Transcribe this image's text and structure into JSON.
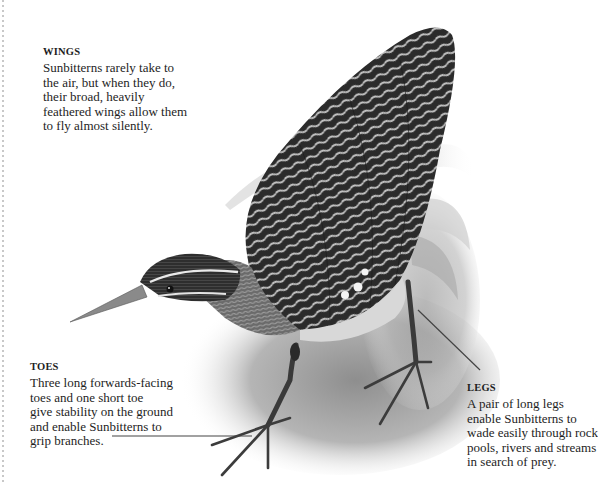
{
  "captions": {
    "wings": {
      "heading": "WINGS",
      "lines": [
        "Sunbitterns rarely take to",
        "the air, but when they do,",
        "their broad, heavily",
        "feathered wings allow them",
        "to fly almost silently."
      ]
    },
    "toes": {
      "heading": "TOES",
      "lines": [
        "Three long forwards-facing",
        "toes and one short toe",
        "give stability on the ground",
        "and enable Sunbitterns to",
        "grip branches."
      ]
    },
    "legs": {
      "heading": "LEGS",
      "lines": [
        "A pair of long legs",
        "enable Sunbitterns to",
        "wade easily through rock",
        "pools, rivers and streams",
        "in search of prey."
      ]
    }
  },
  "illustration": {
    "subject": "Sunbittern",
    "style": "grayscale",
    "colors": {
      "ink": "#1e1e1e",
      "leader_line": "#444444",
      "feather_dark": "#2a2a2a",
      "feather_light": "#bdbdbd"
    }
  }
}
